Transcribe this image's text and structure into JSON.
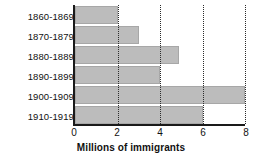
{
  "chart_data": {
    "type": "bar",
    "orientation": "horizontal",
    "title": "",
    "xlabel": "Millions of immigrants",
    "ylabel": "",
    "categories": [
      "1860-1869",
      "1870-1879",
      "1880-1889",
      "1890-1899",
      "1900-1909",
      "1910-1919"
    ],
    "values": [
      2.0,
      3.0,
      4.9,
      4.0,
      8.0,
      6.0
    ],
    "xlim": [
      0,
      8
    ],
    "xticks": [
      0,
      2,
      4,
      6,
      8
    ],
    "xticklabels": [
      "0",
      "2",
      "4",
      "6",
      "8"
    ],
    "grid": "vertical-dotted",
    "legend": null,
    "bar_color": "#bcbcbc",
    "axis_color": "#1a1a1a",
    "gridline_color": "#2b2b2b"
  }
}
